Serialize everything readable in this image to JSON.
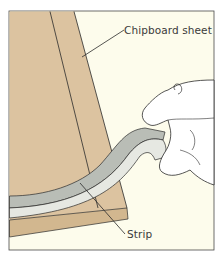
{
  "figure": {
    "type": "illustration",
    "labels": [
      {
        "id": "chipboard",
        "text": "Chipboard sheet"
      },
      {
        "id": "strip",
        "text": "Strip"
      }
    ],
    "colors": {
      "background": "#fdfcec",
      "board": "#dcc3a0",
      "board_edge": "#d2b78f",
      "strip_outer": "#b9bdb6",
      "strip_inner": "#e6e8e2",
      "outline": "#2b2b2b",
      "hand": "#ffffff"
    }
  }
}
